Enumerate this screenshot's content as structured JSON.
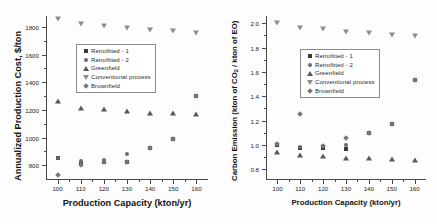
{
  "figure": {
    "panels": [
      "left",
      "right"
    ],
    "background_color": "#fdfdfd",
    "marker_colors": {
      "retrofitted_1": "#3a3a3a",
      "retrofitted_2": "#6a6a6a",
      "greenfield": "#585858",
      "conventional_process": "#8d8d8d",
      "brownfield": "#777777"
    }
  },
  "legend": {
    "items": [
      {
        "label": "Retrofitted - 1",
        "marker": "square-marker-icon"
      },
      {
        "label": "Retrofitted - 2",
        "marker": "circle-marker-icon"
      },
      {
        "label": "Greenfield",
        "marker": "triangle-up-marker-icon"
      },
      {
        "label": "Conventional process",
        "marker": "triangle-down-marker-icon"
      },
      {
        "label": "Brownfield",
        "marker": "diamond-marker-icon"
      }
    ]
  },
  "chart_data": [
    {
      "id": "annualized-production-cost",
      "type": "scatter",
      "title": "",
      "xlabel": "Production Capacity (kton/yr)",
      "ylabel": "Annualized Production Cost, $/ton",
      "x": [
        100,
        110,
        120,
        130,
        140,
        150,
        160
      ],
      "xlim": [
        95,
        165
      ],
      "ylim": [
        700,
        1880
      ],
      "xticks": [
        100,
        110,
        120,
        130,
        140,
        150,
        160
      ],
      "yticks": [
        800,
        1000,
        1200,
        1400,
        1600,
        1800
      ],
      "grid": false,
      "legend_position": "upper-left-inside",
      "series": [
        {
          "name": "Retrofitted - 1",
          "marker": "square",
          "values": [
            850,
            805,
            820,
            820,
            925,
            990,
            1300
          ]
        },
        {
          "name": "Retrofitted - 2",
          "marker": "circle",
          "values": [
            850,
            830,
            840,
            880,
            925,
            990,
            1300
          ]
        },
        {
          "name": "Greenfield",
          "marker": "triangle-up",
          "values": [
            1265,
            1215,
            1205,
            1190,
            1180,
            1175,
            1170
          ]
        },
        {
          "name": "Conventional process",
          "marker": "triangle-down",
          "values": [
            1855,
            1820,
            1805,
            1790,
            1782,
            1772,
            1760
          ]
        },
        {
          "name": "Brownfield",
          "marker": "diamond",
          "values": [
            730,
            800,
            820,
            820,
            925,
            990,
            1300
          ]
        }
      ]
    },
    {
      "id": "carbon-emission",
      "type": "scatter",
      "title": "",
      "xlabel": "Production Capacity (kton/yr)",
      "ylabel": "Carbon Emission (kton of CO2 / kton of EO)",
      "ylabel_parts": {
        "pre": "Carbon Emission (kton of CO",
        "sub": "2",
        "post": " / kton of EO)"
      },
      "x": [
        100,
        110,
        120,
        130,
        140,
        150,
        160
      ],
      "xlim": [
        95,
        165
      ],
      "ylim": [
        0.72,
        2.06
      ],
      "xticks": [
        100,
        110,
        120,
        130,
        140,
        150,
        160
      ],
      "yticks": [
        "0.8",
        "1.0",
        "1.2",
        "1.4",
        "1.6",
        "1.8",
        "2.0"
      ],
      "ytick_values": [
        0.8,
        1.0,
        1.2,
        1.4,
        1.6,
        1.8,
        2.0
      ],
      "grid": false,
      "legend_position": "upper-left-inside",
      "series": [
        {
          "name": "Retrofitted - 1",
          "marker": "square",
          "values": [
            1.0,
            0.975,
            0.975,
            0.965,
            1.095,
            1.17,
            1.53
          ]
        },
        {
          "name": "Retrofitted - 2",
          "marker": "circle",
          "values": [
            1.01,
            0.985,
            0.99,
            1.0,
            1.095,
            1.17,
            1.53
          ]
        },
        {
          "name": "Greenfield",
          "marker": "triangle-up",
          "values": [
            0.945,
            0.915,
            0.905,
            0.895,
            0.895,
            0.885,
            0.88
          ]
        },
        {
          "name": "Conventional process",
          "marker": "triangle-down",
          "values": [
            2.0,
            1.965,
            1.95,
            1.93,
            1.92,
            1.905,
            1.895
          ]
        },
        {
          "name": "Brownfield",
          "marker": "diamond",
          "values": [
            1.01,
            1.255,
            0.99,
            1.06,
            1.095,
            1.17,
            1.53
          ]
        }
      ]
    }
  ]
}
